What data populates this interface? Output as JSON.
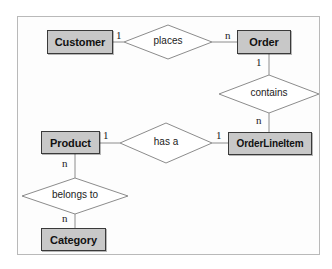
{
  "diagram": {
    "type": "entity-relationship-diagram",
    "frame": {
      "border_color": "#b9b9b9",
      "background": "#fdfdfd"
    },
    "entity_style": {
      "fill": "#c8c8c8",
      "border": "#3a3a3a"
    },
    "relationship_style": {
      "fill": "#ffffff",
      "border": "#8c8c8c"
    },
    "entities": [
      {
        "id": "customer",
        "label": "Customer"
      },
      {
        "id": "order",
        "label": "Order"
      },
      {
        "id": "orderlineitem",
        "label": "OrderLineItem"
      },
      {
        "id": "product",
        "label": "Product"
      },
      {
        "id": "category",
        "label": "Category"
      }
    ],
    "relationships": [
      {
        "id": "places",
        "label": "places",
        "from": "Customer",
        "to": "Order",
        "from_cardinality": "1",
        "to_cardinality": "n"
      },
      {
        "id": "contains",
        "label": "contains",
        "from": "Order",
        "to": "OrderLineItem",
        "from_cardinality": "1",
        "to_cardinality": "n"
      },
      {
        "id": "has-a",
        "label": "has a",
        "from": "Product",
        "to": "OrderLineItem",
        "from_cardinality": "1",
        "to_cardinality": "1"
      },
      {
        "id": "belongs-to",
        "label": "belongs to",
        "from": "Product",
        "to": "Category",
        "from_cardinality": "n",
        "to_cardinality": "n"
      }
    ],
    "cardinalities": {
      "customer_places": "1",
      "places_order": "n",
      "order_contains": "1",
      "contains_orderlineitem": "n",
      "product_hasa": "1",
      "hasa_orderlineitem": "1",
      "product_belongsto": "n",
      "belongsto_category": "n"
    }
  }
}
